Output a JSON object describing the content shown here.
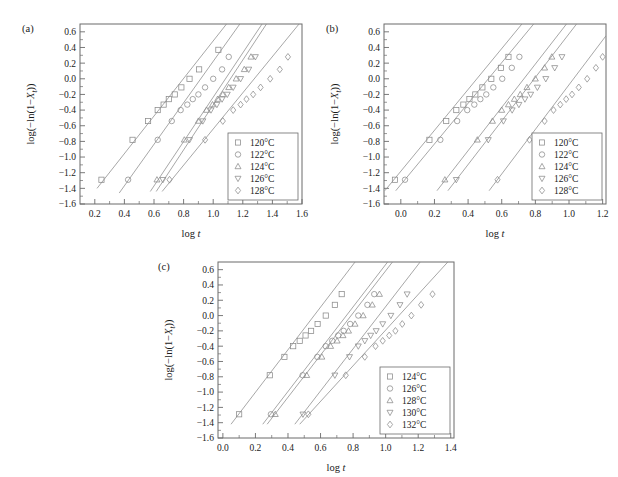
{
  "figure": {
    "background": "#ffffff",
    "line_color": "#8a8a8a",
    "axis_color": "#6b6b6b",
    "text_color": "#1a1a1a"
  },
  "chart_data": [
    {
      "type": "scatter",
      "panel": "(a)",
      "title": "",
      "xlabel": "log t",
      "ylabel": "log(−ln(1−Xₜ))",
      "xlim": [
        0.1,
        1.6
      ],
      "ylim": [
        -1.6,
        0.7
      ],
      "xticks": [
        0.2,
        0.4,
        0.6,
        0.8,
        1.0,
        1.2,
        1.4,
        1.6
      ],
      "xticklabels": [
        "0.2",
        "0.4",
        "0.6",
        "0.8",
        "1.0",
        "1.2",
        "1.4",
        "1.6"
      ],
      "yticks": [
        0.6,
        0.4,
        0.2,
        0.0,
        -0.2,
        -0.4,
        -0.6,
        -0.8,
        -1.0,
        -1.2,
        -1.4,
        -1.6
      ],
      "yticklabels": [
        "0.6",
        "0.4",
        "0.2",
        "0.0",
        "−0.2",
        "−0.4",
        "−0.6",
        "−0.8",
        "−1.0",
        "−1.2",
        "−1.4",
        "−1.6"
      ],
      "grid": false,
      "legend_position": "lower right",
      "series": [
        {
          "name": "120°C",
          "marker": "square",
          "x": [
            0.245,
            0.455,
            0.56,
            0.625,
            0.665,
            0.7,
            0.74,
            0.785,
            0.84,
            0.905,
            1.035
          ],
          "y": [
            -1.29,
            -0.78,
            -0.54,
            -0.4,
            -0.33,
            -0.26,
            -0.2,
            -0.11,
            0.0,
            0.12,
            0.37
          ],
          "fit": {
            "x0": 0.215,
            "y0": -1.4,
            "x1": 1.09,
            "y1": 0.7
          }
        },
        {
          "name": "122°C",
          "marker": "circle",
          "x": [
            0.425,
            0.625,
            0.72,
            0.78,
            0.825,
            0.862,
            0.9,
            0.945,
            1.0,
            1.06,
            1.105
          ],
          "y": [
            -1.29,
            -0.78,
            -0.54,
            -0.4,
            -0.33,
            -0.26,
            -0.2,
            -0.11,
            0.0,
            0.12,
            0.28
          ],
          "fit": {
            "x0": 0.365,
            "y0": -1.46,
            "x1": 1.18,
            "y1": 0.7
          }
        },
        {
          "name": "124°C",
          "marker": "triangle-up",
          "x": [
            0.62,
            0.805,
            0.9,
            0.955,
            0.995,
            1.03,
            1.065,
            1.105,
            1.155,
            1.21,
            1.255
          ],
          "y": [
            -1.29,
            -0.78,
            -0.54,
            -0.4,
            -0.33,
            -0.26,
            -0.2,
            -0.11,
            0.0,
            0.12,
            0.28
          ],
          "fit": {
            "x0": 0.575,
            "y0": -1.44,
            "x1": 1.33,
            "y1": 0.7
          }
        },
        {
          "name": "126°C",
          "marker": "triangle-down",
          "x": [
            0.66,
            0.84,
            0.93,
            0.985,
            1.025,
            1.06,
            1.095,
            1.135,
            1.185,
            1.24,
            1.285
          ],
          "y": [
            -1.29,
            -0.78,
            -0.54,
            -0.4,
            -0.33,
            -0.26,
            -0.2,
            -0.11,
            0.0,
            0.12,
            0.28
          ],
          "fit": {
            "x0": 0.615,
            "y0": -1.44,
            "x1": 1.36,
            "y1": 0.7
          }
        },
        {
          "name": "128°C",
          "marker": "diamond",
          "x": [
            0.705,
            0.945,
            1.065,
            1.135,
            1.185,
            1.225,
            1.27,
            1.32,
            1.385,
            1.45,
            1.505
          ],
          "y": [
            -1.29,
            -0.78,
            -0.54,
            -0.4,
            -0.33,
            -0.26,
            -0.2,
            -0.11,
            0.0,
            0.12,
            0.28
          ],
          "fit": {
            "x0": 0.655,
            "y0": -1.44,
            "x1": 1.58,
            "y1": 0.7
          }
        }
      ]
    },
    {
      "type": "scatter",
      "panel": "(b)",
      "title": "",
      "xlabel": "log t",
      "ylabel": "log(−ln(1−Xₜ))",
      "xlim": [
        -0.1,
        1.22
      ],
      "ylim": [
        -1.6,
        0.7
      ],
      "xticks": [
        0.0,
        0.2,
        0.4,
        0.6,
        0.8,
        1.0,
        1.2
      ],
      "xticklabels": [
        "0.0",
        "0.2",
        "0.4",
        "0.6",
        "0.8",
        "1.0",
        "1.2"
      ],
      "yticks": [
        0.6,
        0.4,
        0.2,
        0.0,
        -0.2,
        -0.4,
        -0.6,
        -0.8,
        -1.0,
        -1.2,
        -1.4,
        -1.6
      ],
      "yticklabels": [
        "0.6",
        "0.4",
        "0.2",
        "0.0",
        "−0.2",
        "−0.4",
        "−0.6",
        "−0.8",
        "−1.0",
        "−1.2",
        "−1.4",
        "−1.6"
      ],
      "grid": false,
      "legend_position": "lower right",
      "series": [
        {
          "name": "120°C",
          "marker": "square",
          "x": [
            -0.035,
            0.17,
            0.27,
            0.33,
            0.372,
            0.408,
            0.443,
            0.485,
            0.538,
            0.595,
            0.64
          ],
          "y": [
            -1.29,
            -0.78,
            -0.54,
            -0.4,
            -0.33,
            -0.26,
            -0.2,
            -0.11,
            0.0,
            0.14,
            0.28
          ],
          "fit": {
            "x0": -0.095,
            "y0": -1.43,
            "x1": 0.72,
            "y1": 0.7
          }
        },
        {
          "name": "122°C",
          "marker": "circle",
          "x": [
            0.025,
            0.235,
            0.335,
            0.395,
            0.437,
            0.473,
            0.508,
            0.55,
            0.603,
            0.66,
            0.705
          ],
          "y": [
            -1.29,
            -0.78,
            -0.54,
            -0.4,
            -0.33,
            -0.26,
            -0.2,
            -0.11,
            0.0,
            0.14,
            0.28
          ],
          "fit": {
            "x0": -0.03,
            "y0": -1.43,
            "x1": 0.79,
            "y1": 0.7
          }
        },
        {
          "name": "124°C",
          "marker": "triangle-up",
          "x": [
            0.262,
            0.455,
            0.545,
            0.6,
            0.64,
            0.675,
            0.71,
            0.75,
            0.8,
            0.855,
            0.898
          ],
          "y": [
            -1.29,
            -0.78,
            -0.54,
            -0.4,
            -0.33,
            -0.26,
            -0.2,
            -0.11,
            0.0,
            0.14,
            0.28
          ],
          "fit": {
            "x0": 0.215,
            "y0": -1.43,
            "x1": 0.985,
            "y1": 0.7
          }
        },
        {
          "name": "126°C",
          "marker": "triangle-down",
          "x": [
            0.33,
            0.52,
            0.61,
            0.662,
            0.702,
            0.738,
            0.772,
            0.812,
            0.862,
            0.915,
            0.958
          ],
          "y": [
            -1.29,
            -0.78,
            -0.54,
            -0.4,
            -0.33,
            -0.26,
            -0.2,
            -0.11,
            0.0,
            0.14,
            0.28
          ],
          "fit": {
            "x0": 0.28,
            "y0": -1.43,
            "x1": 1.045,
            "y1": 0.7
          }
        },
        {
          "name": "128°C",
          "marker": "diamond",
          "x": [
            0.575,
            0.765,
            0.855,
            0.908,
            0.948,
            0.983,
            1.018,
            1.058,
            1.108,
            1.16,
            1.2
          ],
          "y": [
            -1.29,
            -0.78,
            -0.54,
            -0.4,
            -0.33,
            -0.26,
            -0.2,
            -0.11,
            0.0,
            0.14,
            0.28
          ],
          "fit": {
            "x0": 0.525,
            "y0": -1.43,
            "x1": 1.22,
            "y1": 0.55
          }
        }
      ]
    },
    {
      "type": "scatter",
      "panel": "(c)",
      "title": "",
      "xlabel": "log t",
      "ylabel": "log(−ln(1−Xₜ))",
      "xlim": [
        -0.03,
        1.42
      ],
      "ylim": [
        -1.6,
        0.7
      ],
      "xticks": [
        0.0,
        0.2,
        0.4,
        0.6,
        0.8,
        1.0,
        1.2,
        1.4
      ],
      "xticklabels": [
        "0.0",
        "0.2",
        "0.4",
        "0.6",
        "0.8",
        "1.0",
        "1.2",
        "1.4"
      ],
      "yticks": [
        0.6,
        0.4,
        0.2,
        0.0,
        -0.2,
        -0.4,
        -0.6,
        -0.8,
        -1.0,
        -1.2,
        -1.4,
        -1.6
      ],
      "yticklabels": [
        "0.6",
        "0.4",
        "0.2",
        "0.0",
        "−0.2",
        "−0.4",
        "−0.6",
        "−0.8",
        "−1.0",
        "−1.2",
        "−1.4",
        "−1.6"
      ],
      "grid": false,
      "legend_position": "lower right",
      "series": [
        {
          "name": "124°C",
          "marker": "square",
          "x": [
            0.1,
            0.288,
            0.378,
            0.432,
            0.472,
            0.508,
            0.542,
            0.582,
            0.632,
            0.688,
            0.73
          ],
          "y": [
            -1.29,
            -0.78,
            -0.54,
            -0.4,
            -0.33,
            -0.26,
            -0.2,
            -0.11,
            0.0,
            0.14,
            0.28
          ],
          "fit": {
            "x0": 0.05,
            "y0": -1.42,
            "x1": 0.812,
            "y1": 0.7
          }
        },
        {
          "name": "126°C",
          "marker": "circle",
          "x": [
            0.295,
            0.49,
            0.58,
            0.632,
            0.672,
            0.708,
            0.742,
            0.782,
            0.832,
            0.888,
            0.93
          ],
          "y": [
            -1.29,
            -0.78,
            -0.54,
            -0.4,
            -0.33,
            -0.26,
            -0.2,
            -0.11,
            0.0,
            0.14,
            0.28
          ],
          "fit": {
            "x0": 0.245,
            "y0": -1.42,
            "x1": 1.012,
            "y1": 0.7
          }
        },
        {
          "name": "128°C",
          "marker": "triangle-up",
          "x": [
            0.322,
            0.515,
            0.608,
            0.662,
            0.702,
            0.738,
            0.772,
            0.812,
            0.862,
            0.918,
            0.962
          ],
          "y": [
            -1.29,
            -0.78,
            -0.54,
            -0.4,
            -0.33,
            -0.26,
            -0.2,
            -0.11,
            0.0,
            0.14,
            0.28
          ],
          "fit": {
            "x0": 0.272,
            "y0": -1.42,
            "x1": 1.042,
            "y1": 0.7
          }
        },
        {
          "name": "130°C",
          "marker": "triangle-down",
          "x": [
            0.492,
            0.688,
            0.778,
            0.832,
            0.872,
            0.908,
            0.942,
            0.982,
            1.032,
            1.088,
            1.132
          ],
          "y": [
            -1.29,
            -0.78,
            -0.54,
            -0.4,
            -0.33,
            -0.26,
            -0.2,
            -0.11,
            0.0,
            0.14,
            0.28
          ],
          "fit": {
            "x0": 0.442,
            "y0": -1.42,
            "x1": 1.212,
            "y1": 0.7
          }
        },
        {
          "name": "132°C",
          "marker": "diamond",
          "x": [
            0.525,
            0.755,
            0.872,
            0.938,
            0.982,
            1.022,
            1.06,
            1.102,
            1.158,
            1.218,
            1.288
          ],
          "y": [
            -1.29,
            -0.78,
            -0.54,
            -0.4,
            -0.33,
            -0.26,
            -0.2,
            -0.11,
            0.0,
            0.14,
            0.28
          ],
          "fit": {
            "x0": 0.472,
            "y0": -1.42,
            "x1": 1.382,
            "y1": 0.7
          }
        }
      ]
    }
  ]
}
